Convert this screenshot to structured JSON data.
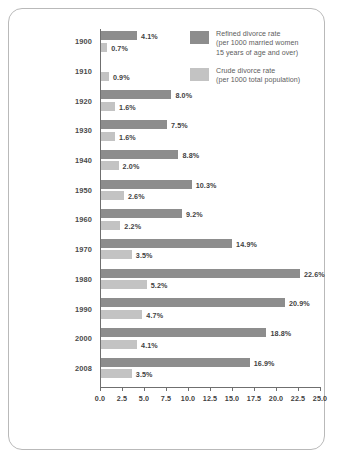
{
  "chart_data": {
    "type": "bar",
    "orientation": "horizontal",
    "title": "",
    "subtitle": "",
    "xlabel": "",
    "ylabel": "",
    "xlim": [
      0.0,
      25.0
    ],
    "xticks": [
      "0.0",
      "2.5",
      "5.0",
      "7.5",
      "10.0",
      "12.5",
      "15.0",
      "17.5",
      "20.0",
      "22.5",
      "25.0"
    ],
    "xtick_values": [
      0.0,
      2.5,
      5.0,
      7.5,
      10.0,
      12.5,
      15.0,
      17.5,
      20.0,
      22.5,
      25.0
    ],
    "grid": false,
    "legend_position": "top-right",
    "categories": [
      "1900",
      "1910",
      "1920",
      "1930",
      "1940",
      "1950",
      "1960",
      "1970",
      "1980",
      "1990",
      "2000",
      "2008"
    ],
    "series": [
      {
        "name": "Refined divorce rate",
        "color": "#8d8d8d",
        "values": [
          4.1,
          null,
          8.0,
          7.5,
          8.8,
          10.3,
          9.2,
          14.9,
          22.6,
          20.9,
          18.8,
          16.9
        ],
        "labels": [
          "4.1%",
          "",
          "8.0%",
          "7.5%",
          "8.8%",
          "10.3%",
          "9.2%",
          "14.9%",
          "22.6%",
          "20.9%",
          "18.8%",
          "16.9%"
        ]
      },
      {
        "name": "Crude divorce rate",
        "color": "#c3c3c3",
        "values": [
          0.7,
          0.9,
          1.6,
          1.6,
          2.0,
          2.6,
          2.2,
          3.5,
          5.2,
          4.7,
          4.1,
          3.5
        ],
        "labels": [
          "0.7%",
          "0.9%",
          "1.6%",
          "1.6%",
          "2.0%",
          "2.6%",
          "2.2%",
          "3.5%",
          "5.2%",
          "4.7%",
          "4.1%",
          "3.5%"
        ]
      }
    ]
  },
  "legend": {
    "entries": [
      {
        "title": "Refined divorce rate",
        "subtitle": "(per 1000 married women 15 years of age and over)",
        "sub_line1": "(per 1000 married women",
        "sub_line2": "15 years of age and over)",
        "color": "#8d8d8d"
      },
      {
        "title": "Crude divorce rate",
        "subtitle": "(per 1000 total population)",
        "sub_line1": "(per 1000 total population)",
        "sub_line2": "",
        "color": "#c3c3c3"
      }
    ]
  },
  "colors": {
    "refined": "#8d8d8d",
    "crude": "#c3c3c3",
    "axis": "#6f6f6f",
    "frame": "#b9b9b9",
    "text": "#3f3f3f"
  }
}
